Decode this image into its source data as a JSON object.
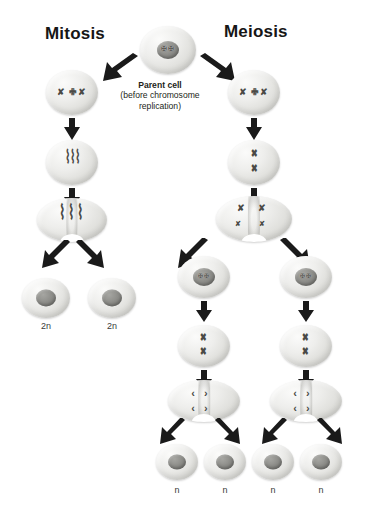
{
  "titles": {
    "left": "Mitosis",
    "right": "Meiosis"
  },
  "parent_cell": {
    "label_bold": "Parent cell",
    "label_line2": "(before chromosome",
    "label_line3": "replication)"
  },
  "ploidy_labels": {
    "mitosis": [
      "2n",
      "2n"
    ],
    "meiosis": [
      "n",
      "n",
      "n",
      "n"
    ]
  },
  "chromosome_glyphs": {
    "parent": "✠✠",
    "replicated": "✘ ✙✘",
    "aligned_single": "✖",
    "aligned_pair": "✖\n✖",
    "metaphase_mitosis": "⌇⌇⌇",
    "metaphase_meiosis_top": "✘ ✘",
    "metaphase_meiosis_bottom": "✘  ✘",
    "anaphase": "‹›"
  },
  "colors": {
    "background": "#ffffff",
    "text": "#231f20",
    "arrow": "#1a1a1a",
    "cell_fill": "#eeeeec",
    "nucleus": "#8f8f8b",
    "chromosome": "#4a4a46"
  },
  "diagram": {
    "type": "biology-process-diagram",
    "branches": [
      {
        "name": "Mitosis",
        "stages": [
          "chromosome replication",
          "chromosome alignment",
          "chromosome separation"
        ],
        "daughter_cells": 2,
        "ploidy": "2n"
      },
      {
        "name": "Meiosis",
        "stages": [
          "chromosome replication",
          "homolog pairing",
          "meiosis I division",
          "meiosis II alignment",
          "meiosis II separation"
        ],
        "daughter_cells": 4,
        "ploidy": "n"
      }
    ]
  }
}
